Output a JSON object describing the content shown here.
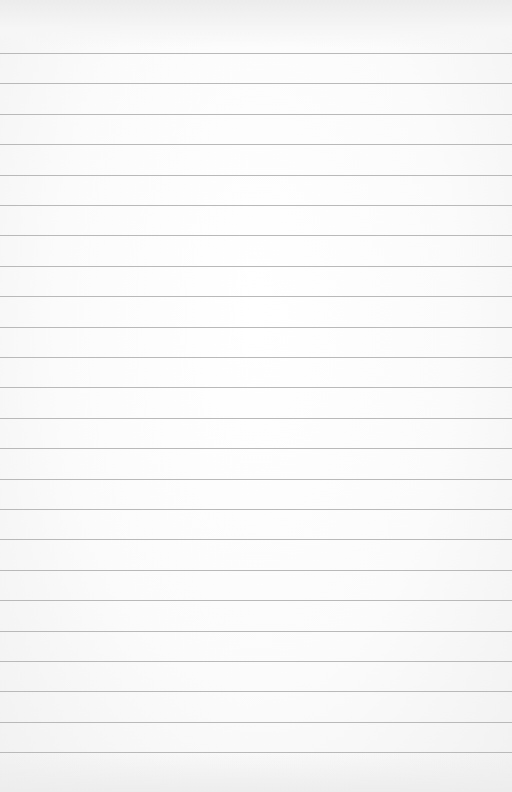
{
  "paper": {
    "type": "lined-paper",
    "background_color": "#fbfbfb",
    "line_color": "#b9b9b9",
    "line_count": 24,
    "first_line_y": 53,
    "line_spacing": 30.4
  }
}
